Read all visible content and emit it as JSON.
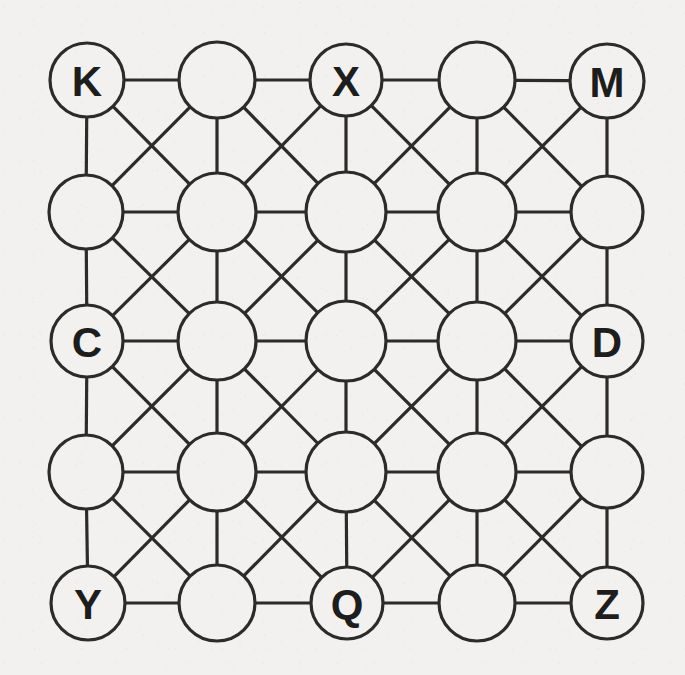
{
  "figure": {
    "type": "graph-diagram",
    "background_color": "#f2f1ef",
    "stroke_color": "#2b2b2b",
    "node_fill_color": "#f2f1ef",
    "label_color": "#1d1d1d"
  },
  "grid": {
    "rows": 5,
    "cols": 5,
    "col_centers_px": [
      87,
      217,
      346,
      477,
      607
    ],
    "row_centers_px": [
      80,
      212,
      341,
      472,
      603
    ],
    "edge_types": [
      "horizontal",
      "vertical",
      "diagonal-down-right",
      "diagonal-down-left"
    ],
    "stroke_width_px": 3.2
  },
  "nodes": [
    {
      "id": "n-0-0",
      "row": 0,
      "col": 0,
      "cx": 87,
      "cy": 80,
      "r": 37,
      "label": "K",
      "labeled": true
    },
    {
      "id": "n-0-1",
      "row": 0,
      "col": 1,
      "cx": 217,
      "cy": 80,
      "r": 38,
      "label": "",
      "labeled": false
    },
    {
      "id": "n-0-2",
      "row": 0,
      "col": 2,
      "cx": 346,
      "cy": 80,
      "r": 36,
      "label": "X",
      "labeled": true
    },
    {
      "id": "n-0-3",
      "row": 0,
      "col": 3,
      "cx": 477,
      "cy": 80,
      "r": 38,
      "label": "",
      "labeled": false
    },
    {
      "id": "n-0-4",
      "row": 0,
      "col": 4,
      "cx": 607,
      "cy": 81,
      "r": 37,
      "label": "M",
      "labeled": true
    },
    {
      "id": "n-1-0",
      "row": 1,
      "col": 0,
      "cx": 86,
      "cy": 212,
      "r": 37,
      "label": "",
      "labeled": false
    },
    {
      "id": "n-1-1",
      "row": 1,
      "col": 1,
      "cx": 217,
      "cy": 212,
      "r": 39,
      "label": "",
      "labeled": false
    },
    {
      "id": "n-1-2",
      "row": 1,
      "col": 2,
      "cx": 346,
      "cy": 212,
      "r": 40,
      "label": "",
      "labeled": false
    },
    {
      "id": "n-1-3",
      "row": 1,
      "col": 3,
      "cx": 477,
      "cy": 212,
      "r": 39,
      "label": "",
      "labeled": false
    },
    {
      "id": "n-1-4",
      "row": 1,
      "col": 4,
      "cx": 607,
      "cy": 212,
      "r": 36,
      "label": "",
      "labeled": false
    },
    {
      "id": "n-2-0",
      "row": 2,
      "col": 0,
      "cx": 87,
      "cy": 341,
      "r": 36,
      "label": "C",
      "labeled": true
    },
    {
      "id": "n-2-1",
      "row": 2,
      "col": 1,
      "cx": 217,
      "cy": 341,
      "r": 39,
      "label": "",
      "labeled": false
    },
    {
      "id": "n-2-2",
      "row": 2,
      "col": 2,
      "cx": 346,
      "cy": 341,
      "r": 40,
      "label": "",
      "labeled": false
    },
    {
      "id": "n-2-3",
      "row": 2,
      "col": 3,
      "cx": 477,
      "cy": 341,
      "r": 39,
      "label": "",
      "labeled": false
    },
    {
      "id": "n-2-4",
      "row": 2,
      "col": 4,
      "cx": 607,
      "cy": 341,
      "r": 36,
      "label": "D",
      "labeled": true
    },
    {
      "id": "n-3-0",
      "row": 3,
      "col": 0,
      "cx": 86,
      "cy": 472,
      "r": 37,
      "label": "",
      "labeled": false
    },
    {
      "id": "n-3-1",
      "row": 3,
      "col": 1,
      "cx": 217,
      "cy": 472,
      "r": 39,
      "label": "",
      "labeled": false
    },
    {
      "id": "n-3-2",
      "row": 3,
      "col": 2,
      "cx": 346,
      "cy": 472,
      "r": 40,
      "label": "",
      "labeled": false
    },
    {
      "id": "n-3-3",
      "row": 3,
      "col": 3,
      "cx": 477,
      "cy": 472,
      "r": 39,
      "label": "",
      "labeled": false
    },
    {
      "id": "n-3-4",
      "row": 3,
      "col": 4,
      "cx": 607,
      "cy": 472,
      "r": 36,
      "label": "",
      "labeled": false
    },
    {
      "id": "n-4-0",
      "row": 4,
      "col": 0,
      "cx": 88,
      "cy": 603,
      "r": 37,
      "label": "Y",
      "labeled": true
    },
    {
      "id": "n-4-1",
      "row": 4,
      "col": 1,
      "cx": 217,
      "cy": 603,
      "r": 38,
      "label": "",
      "labeled": false
    },
    {
      "id": "n-4-2",
      "row": 4,
      "col": 2,
      "cx": 347,
      "cy": 603,
      "r": 36,
      "label": "Q",
      "labeled": true
    },
    {
      "id": "n-4-3",
      "row": 4,
      "col": 3,
      "cx": 477,
      "cy": 603,
      "r": 38,
      "label": "",
      "labeled": false
    },
    {
      "id": "n-4-4",
      "row": 4,
      "col": 4,
      "cx": 607,
      "cy": 603,
      "r": 36,
      "label": "Z",
      "labeled": true
    }
  ],
  "labels_present": [
    "K",
    "X",
    "M",
    "C",
    "D",
    "Y",
    "Q",
    "Z"
  ],
  "labeled_node_count": 8,
  "unlabeled_node_count": 17,
  "total_node_count": 25
}
